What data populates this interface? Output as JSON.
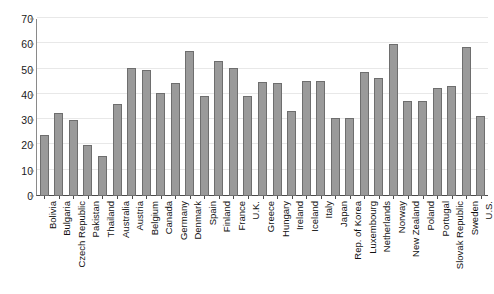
{
  "chart_data": {
    "type": "bar",
    "title": "",
    "subtitle": "",
    "xlabel": "",
    "ylabel": "",
    "ylim": [
      0,
      70
    ],
    "yticks": [
      0,
      10,
      20,
      30,
      40,
      50,
      60,
      70
    ],
    "ytick_labels": [
      "0",
      "10",
      "20",
      "30",
      "40",
      "50",
      "60",
      "70"
    ],
    "grid": true,
    "legend": false,
    "legend_position": "none",
    "orientation": "vertical",
    "bar_color": "#9a9a9a",
    "bar_edge_color": "#6e6e6e",
    "grid_color": "#e8e8e8",
    "axis_color": "#4a4a4a",
    "categories": [
      "Bolivia",
      "Bulgaria",
      "Czech Republic",
      "Pakistan",
      "Thailand",
      "Australia",
      "Austria",
      "Belgium",
      "Canada",
      "Germany",
      "Denmark",
      "Spain",
      "Finland",
      "France",
      "U.K.",
      "Greece",
      "Hungary",
      "Ireland",
      "Iceland",
      "Italy",
      "Japan",
      "Rep. of Korea",
      "Luxembourg",
      "Netherlands",
      "Norway",
      "New Zealand",
      "Poland",
      "Portugal",
      "Slovak Republic",
      "Sweden",
      "U.S."
    ],
    "values": [
      24.3,
      33.0,
      30.0,
      20.0,
      16.0,
      36.5,
      50.7,
      49.9,
      40.7,
      44.8,
      57.2,
      39.6,
      53.3,
      50.8,
      39.6,
      45.0,
      44.8,
      33.6,
      45.5,
      45.5,
      31.0,
      31.0,
      49.0,
      46.5,
      60.0,
      37.7,
      37.7,
      42.8,
      43.5,
      59.0,
      31.5
    ]
  }
}
